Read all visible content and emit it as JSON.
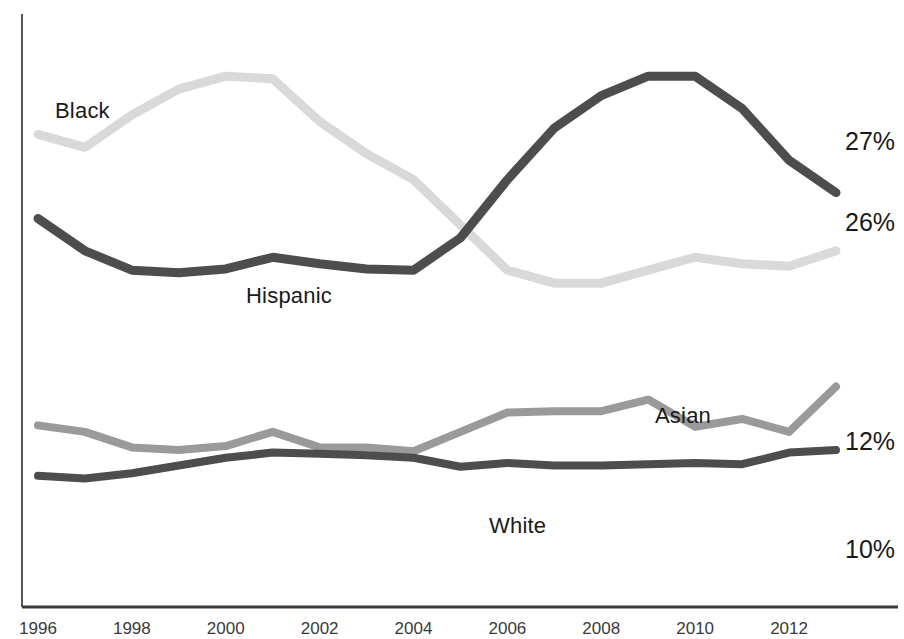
{
  "chart_data": {
    "type": "line",
    "title": "",
    "subtitle": "",
    "xlabel": "",
    "ylabel": "",
    "grid": false,
    "legend_position": "inline-labels",
    "x": [
      1996,
      1997,
      1998,
      1999,
      2000,
      2001,
      2002,
      2003,
      2004,
      2005,
      2006,
      2007,
      2008,
      2009,
      2010,
      2011,
      2012,
      2013
    ],
    "tick_labels": [
      "1996",
      "1998",
      "2000",
      "2002",
      "2004",
      "2006",
      "2008",
      "2010",
      "2012"
    ],
    "ylim": [
      0,
      45
    ],
    "series": [
      {
        "name": "Black",
        "color": "#d9d9d9",
        "end_value_label": "27%",
        "values": [
          36.0,
          35.0,
          37.5,
          39.5,
          40.5,
          40.3,
          37.0,
          34.5,
          32.5,
          29.0,
          25.5,
          24.5,
          24.5,
          25.5,
          26.5,
          26.0,
          25.8,
          27.0
        ]
      },
      {
        "name": "Hispanic",
        "color": "#4d4d4d",
        "end_value_label": "26%",
        "values": [
          29.5,
          27.0,
          25.5,
          25.3,
          25.6,
          26.5,
          26.0,
          25.6,
          25.5,
          28.0,
          32.5,
          36.5,
          39.0,
          40.5,
          40.5,
          38.0,
          34.0,
          31.5
        ]
      },
      {
        "name": "Asian",
        "color": "#9a9a9a",
        "end_value_label": "12%",
        "values": [
          13.5,
          13.0,
          11.8,
          11.6,
          11.9,
          13.0,
          11.8,
          11.8,
          11.5,
          13.0,
          14.5,
          14.6,
          14.6,
          15.5,
          13.4,
          14.0,
          13.0,
          16.5
        ]
      },
      {
        "name": "White",
        "color": "#4d4d4d",
        "end_value_label": "10%",
        "values": [
          9.6,
          9.4,
          9.8,
          10.4,
          11.0,
          11.4,
          11.3,
          11.2,
          11.0,
          10.3,
          10.6,
          10.4,
          10.4,
          10.5,
          10.6,
          10.5,
          11.4,
          11.6
        ]
      }
    ]
  },
  "labels": {
    "black": "Black",
    "hispanic": "Hispanic",
    "asian": "Asian",
    "white": "White"
  },
  "values": {
    "black": "27%",
    "hispanic": "26%",
    "asian": "12%",
    "white": "10%"
  }
}
